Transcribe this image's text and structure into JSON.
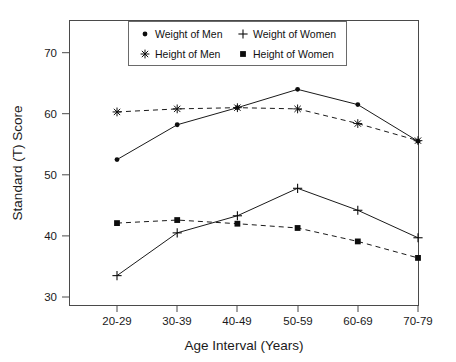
{
  "chart_data": {
    "type": "line",
    "title": "",
    "xlabel": "Age Interval (Years)",
    "ylabel": "Standard (T) Score",
    "categories": [
      "20-29",
      "30-39",
      "40-49",
      "50-59",
      "60-69",
      "70-79"
    ],
    "ylim": [
      30,
      70
    ],
    "yticks": [
      30,
      40,
      50,
      60,
      70
    ],
    "grid": false,
    "legend_position": "top-center",
    "series": [
      {
        "name": "Weight of Men",
        "marker": "filled-circle",
        "linestyle": "solid",
        "values": [
          52.5,
          58.2,
          61.0,
          64.0,
          61.5,
          55.5
        ]
      },
      {
        "name": "Weight of Women",
        "marker": "plus",
        "linestyle": "solid",
        "values": [
          33.5,
          40.5,
          43.3,
          47.8,
          44.2,
          39.7
        ]
      },
      {
        "name": "Height of Men",
        "marker": "asterisk",
        "linestyle": "dashed",
        "values": [
          60.3,
          60.8,
          61.0,
          60.8,
          58.4,
          55.6
        ]
      },
      {
        "name": "Height of Women",
        "marker": "filled-square",
        "linestyle": "dashed",
        "values": [
          42.1,
          42.6,
          42.0,
          41.3,
          39.1,
          36.4
        ]
      }
    ]
  },
  "axes": {
    "y_tick_labels": [
      "70",
      "60",
      "50",
      "40",
      "30"
    ],
    "x_tick_labels": [
      "20-29",
      "30-39",
      "40-49",
      "50-59",
      "60-69",
      "70-79"
    ],
    "y_axis_title": "Standard (T) Score",
    "x_axis_title": "Age Interval (Years)"
  },
  "legend": {
    "entries": [
      {
        "label": "Weight of Men",
        "marker": "filled-circle"
      },
      {
        "label": "Weight of Women",
        "marker": "plus"
      },
      {
        "label": "Height of Men",
        "marker": "asterisk"
      },
      {
        "label": "Height of Women",
        "marker": "filled-square"
      }
    ]
  },
  "colors": {
    "line": "#1a1a1a",
    "frame": "#4a4a4a",
    "text": "#1a1a1a",
    "background": "#ffffff"
  }
}
